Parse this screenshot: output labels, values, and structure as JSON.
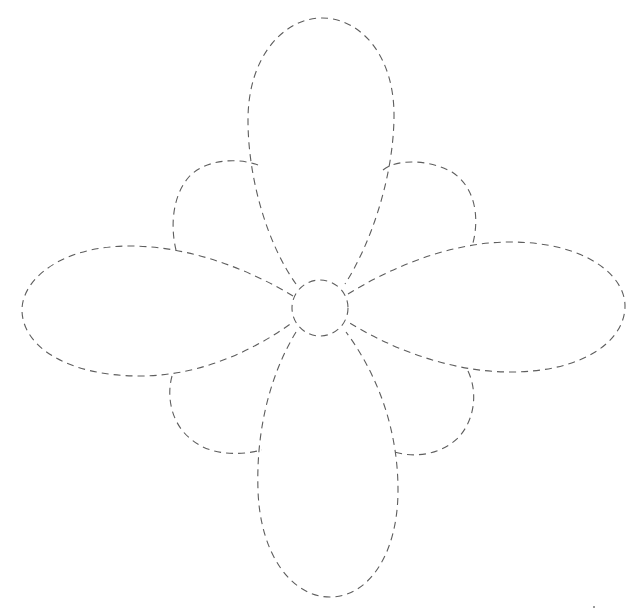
{
  "diagram": {
    "title": "",
    "stroke_color": "#5e5e5e",
    "background_color": "#ffffff",
    "line_style": "dashed",
    "center": {
      "shape": "circle",
      "cx": 320,
      "cy": 308,
      "r": 28
    },
    "petals": [
      {
        "name": "top",
        "extent": "y=18"
      },
      {
        "name": "right",
        "extent": "x=625"
      },
      {
        "name": "bottom",
        "extent": "y=597"
      },
      {
        "name": "left",
        "extent": "x=22"
      }
    ],
    "lobes": [
      {
        "name": "top-left"
      },
      {
        "name": "top-right"
      },
      {
        "name": "bottom-left"
      },
      {
        "name": "bottom-right"
      }
    ]
  }
}
